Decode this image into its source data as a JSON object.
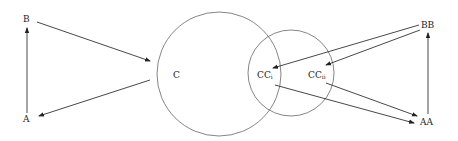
{
  "diagram": {
    "nodes": {
      "B": {
        "label": "B",
        "x": 26,
        "y": 22
      },
      "A": {
        "label": "A",
        "x": 26,
        "y": 120
      },
      "C": {
        "label": "C",
        "x": 176,
        "y": 77
      },
      "CCi": {
        "label": "CC",
        "sub": "i",
        "x": 272,
        "y": 77
      },
      "CCii": {
        "label": "CC",
        "sub": "ii",
        "x": 311,
        "y": 77
      },
      "BB": {
        "label": "BB",
        "x": 424,
        "y": 28
      },
      "AA": {
        "label": "AA",
        "x": 424,
        "y": 124
      }
    },
    "circles": [
      {
        "name": "large-circle",
        "cx": 219,
        "cy": 74,
        "r": 62
      },
      {
        "name": "small-circle",
        "cx": 291,
        "cy": 73,
        "r": 43
      }
    ],
    "edges": [
      {
        "from": "A",
        "to": "B"
      },
      {
        "from": "B",
        "to": "C"
      },
      {
        "from": "C",
        "to": "A"
      },
      {
        "from": "BB",
        "to": "CCi"
      },
      {
        "from": "BB",
        "to": "CCii"
      },
      {
        "from": "CCi",
        "to": "AA"
      },
      {
        "from": "CCii",
        "to": "AA"
      },
      {
        "from": "AA",
        "to": "BB"
      }
    ],
    "colors": {
      "line": "#333333",
      "circle": "#666666",
      "text": "#222222"
    }
  }
}
